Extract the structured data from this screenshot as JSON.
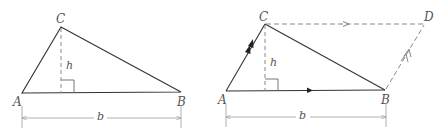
{
  "colors": {
    "solid_line": "#333333",
    "dashed_line": "#888888",
    "dimension_line": "#999999",
    "label": "#555555",
    "background": "#ffffff"
  },
  "figures": [
    {
      "name": "triangle",
      "points": {
        "A": [
          22,
          93
        ],
        "B": [
          181,
          92
        ],
        "C": [
          61,
          27
        ],
        "H": [
          61,
          93
        ]
      },
      "labels": {
        "A": "A",
        "B": "B",
        "C": "C",
        "h": "h",
        "b": "b"
      }
    },
    {
      "name": "parallelogram",
      "points": {
        "A": [
          226,
          91
        ],
        "B": [
          385,
          90
        ],
        "C": [
          265,
          24
        ],
        "D": [
          424,
          24
        ],
        "H": [
          265,
          91
        ]
      },
      "labels": {
        "A": "A",
        "B": "B",
        "C": "C",
        "D": "D",
        "h": "h",
        "b": "b"
      }
    }
  ]
}
